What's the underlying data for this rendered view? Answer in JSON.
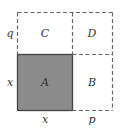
{
  "diagram": {
    "regions": [
      {
        "id": "A",
        "label": "A",
        "shaded": true,
        "fill": "#8c8c8c"
      },
      {
        "id": "B",
        "label": "B",
        "shaded": false
      },
      {
        "id": "C",
        "label": "C",
        "shaded": false
      },
      {
        "id": "D",
        "label": "D",
        "shaded": false
      }
    ],
    "side_labels": {
      "left_top": "q",
      "left_bottom": "x",
      "bottom_left": "x",
      "bottom_right": "p"
    },
    "colors": {
      "shade": "#8c8c8c",
      "line": "#555555"
    }
  }
}
